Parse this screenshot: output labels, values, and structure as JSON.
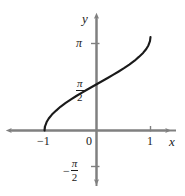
{
  "figure": {
    "title": "",
    "axis_color": "#808080",
    "curve_color": "#1a1a1a",
    "text_color": "#1a1a1a",
    "background": "#ffffff"
  },
  "labels": {
    "y_axis": "y",
    "x_axis": "x",
    "origin": "0",
    "x_tick_neg1": "−1",
    "x_tick_1": "1",
    "y_tick_pi": "π",
    "y_tick_pi_over_2_num": "π",
    "y_tick_pi_over_2_den": "2",
    "y_tick_neg_pi_over_2_minus": "−",
    "y_tick_neg_pi_over_2_num": "π",
    "y_tick_neg_pi_over_2_den": "2"
  },
  "chart_data": {
    "type": "line",
    "title": "",
    "xlabel": "x",
    "ylabel": "y",
    "xlim": [
      -1.55,
      1.45
    ],
    "ylim": [
      -2.2,
      3.8
    ],
    "grid": false,
    "legend": null,
    "x_ticks": [
      -1,
      0,
      1
    ],
    "x_tick_labels": [
      "−1",
      "0",
      "1"
    ],
    "y_ticks": [
      -1.5707963,
      1.5707963,
      3.1415927
    ],
    "y_tick_labels": [
      "−π/2",
      "π/2",
      "π"
    ],
    "series": [
      {
        "name": "y = arccos(-x)",
        "x": [
          -1.0,
          -0.99,
          -0.96,
          -0.92,
          -0.86,
          -0.78,
          -0.7,
          -0.6,
          -0.5,
          -0.4,
          -0.3,
          -0.2,
          -0.1,
          0.0,
          0.1,
          0.2,
          0.3,
          0.4,
          0.5,
          0.6,
          0.7,
          0.78,
          0.86,
          0.92,
          0.96,
          0.99,
          1.0
        ],
        "y": [
          0.0,
          0.1415,
          0.2838,
          0.4027,
          0.5355,
          0.6687,
          0.7954,
          0.9273,
          1.0472,
          1.1593,
          1.2661,
          1.3694,
          1.4706,
          1.5708,
          1.671,
          1.7722,
          1.8755,
          1.9823,
          2.0944,
          2.2143,
          2.3462,
          2.4729,
          2.6061,
          2.7389,
          2.8578,
          3.0001,
          3.1416
        ],
        "endpoint_left": [
          -1,
          0
        ],
        "endpoint_right": [
          1,
          3.1416
        ],
        "description": "Increasing S-shaped curve with vertical tangents at x = −1 (y = 0) and x = 1 (y = π), passing through (0, π/2)"
      }
    ]
  }
}
